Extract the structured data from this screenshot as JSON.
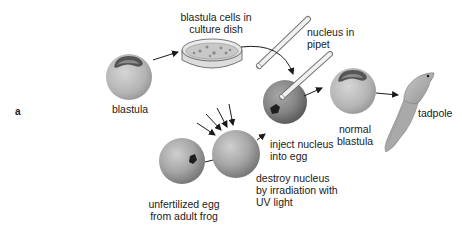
{
  "figure": {
    "panel_label": "a",
    "colors": {
      "sphere_fill": "#a8a8a8",
      "sphere_dark": "#6e6e6e",
      "nucleus": "#1e1e1e",
      "arrow": "#1a1a1a",
      "text": "#1a1a1a"
    }
  },
  "nodes": {
    "blastula": {
      "label": "blastula"
    },
    "culture_dish": {
      "label_line1": "blastula cells in",
      "label_line2": "culture dish"
    },
    "pipet": {
      "label_line1": "nucleus in",
      "label_line2": "pipet"
    },
    "injected_egg": {
      "label_line1": "inject nucleus",
      "label_line2": "into egg"
    },
    "normal_blastula": {
      "label_line1": "normal",
      "label_line2": "blastula"
    },
    "tadpole": {
      "label": "tadpole"
    },
    "unfertilized_egg": {
      "label_line1": "unfertilized egg",
      "label_line2": "from adult frog"
    },
    "irradiated_egg": {
      "label_line1": "destroy nucleus",
      "label_line2": "by irradiation with",
      "label_line3": "UV light"
    }
  },
  "edges": [
    {
      "from": "blastula",
      "to": "culture_dish"
    },
    {
      "from": "culture_dish",
      "to": "pipet"
    },
    {
      "from": "pipet",
      "to": "injected_egg"
    },
    {
      "from": "unfertilized_egg",
      "to": "irradiated_egg"
    },
    {
      "from": "irradiated_egg",
      "to": "injected_egg"
    },
    {
      "from": "injected_egg",
      "to": "normal_blastula"
    },
    {
      "from": "normal_blastula",
      "to": "tadpole"
    }
  ],
  "uv_arrows_count": 4
}
